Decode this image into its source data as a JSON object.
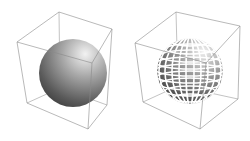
{
  "figure": {
    "panels": [
      {
        "id": "left",
        "description": "smooth shaded sphere inside wireframe bounding box",
        "style": "smooth-shaded"
      },
      {
        "id": "right",
        "description": "sphere rendered as separated quad patches (lat/long grid) inside wireframe bounding box",
        "style": "patch-grid"
      }
    ],
    "colors": {
      "background": "#ffffff",
      "box_edge": "#8a8a8a",
      "sphere_light": "#e6e6e6",
      "sphere_dark": "#3a3a3a"
    }
  }
}
